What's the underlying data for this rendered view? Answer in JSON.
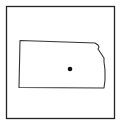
{
  "map": {
    "region": "Kansas",
    "frame_color": "#222222",
    "outline_color": "#333333",
    "marker_color": "#111111",
    "marker": {
      "label": "location-marker",
      "x": 70,
      "y": 69
    }
  }
}
